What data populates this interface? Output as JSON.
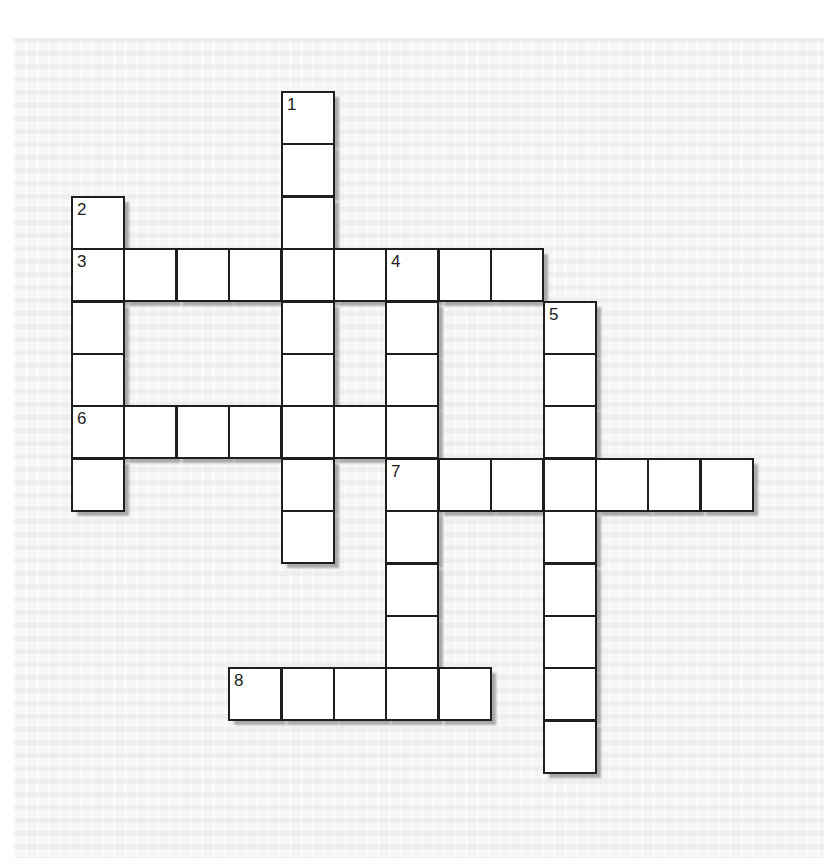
{
  "puzzle": {
    "type": "crossword",
    "cell_size": 52.4,
    "origin": {
      "x": 71,
      "y": 91
    },
    "colors": {
      "cell_fill": "#ffffff",
      "cell_border": "#1e1e1e",
      "shadow": "#a9a9a9",
      "paper": "#f6f6f6"
    },
    "entries": [
      {
        "number": "1",
        "direction": "down",
        "row": 0,
        "col": 4,
        "length": 9
      },
      {
        "number": "2",
        "direction": "down",
        "row": 2,
        "col": 0,
        "length": 6
      },
      {
        "number": "3",
        "direction": "across",
        "row": 3,
        "col": 0,
        "length": 9
      },
      {
        "number": "4",
        "direction": "down",
        "row": 3,
        "col": 6,
        "length": 9
      },
      {
        "number": "5",
        "direction": "down",
        "row": 4,
        "col": 9,
        "length": 9
      },
      {
        "number": "6",
        "direction": "across",
        "row": 6,
        "col": 0,
        "length": 7
      },
      {
        "number": "7",
        "direction": "across",
        "row": 7,
        "col": 6,
        "length": 7
      },
      {
        "number": "8",
        "direction": "across",
        "row": 11,
        "col": 3,
        "length": 5
      }
    ]
  }
}
